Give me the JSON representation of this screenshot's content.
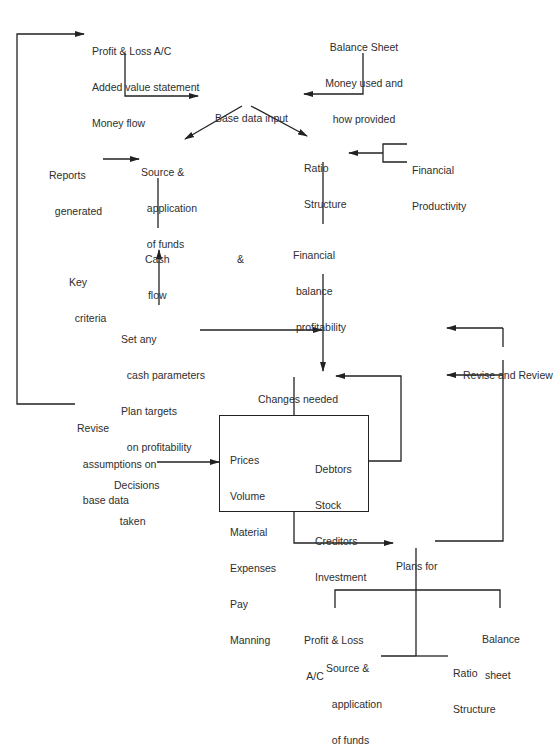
{
  "diagram": {
    "colors": {
      "ink": "#222222",
      "text": "#2e2e2e",
      "background": "#ffffff"
    },
    "nodes": {
      "profit_loss_top": {
        "lines": [
          "Profit & Loss A/C",
          "Added value statement",
          "Money flow"
        ]
      },
      "balance_sheet_top": {
        "lines": [
          "Balance Sheet",
          "Money used and",
          "how provided"
        ]
      },
      "base_data_input": {
        "lines": [
          "Base data input"
        ]
      },
      "reports_generated": {
        "lines": [
          "Reports",
          "  generated"
        ]
      },
      "source_application": {
        "lines": [
          "Source &",
          "  application",
          "  of funds"
        ]
      },
      "ratio_structure": {
        "lines": [
          "Ratio",
          "Structure"
        ]
      },
      "financial_productivity": {
        "lines": [
          "Financial",
          "Productivity"
        ]
      },
      "cash_flow": {
        "lines": [
          "Cash",
          " flow"
        ]
      },
      "ampersand": {
        "lines": [
          "&"
        ]
      },
      "financial_balance": {
        "lines": [
          "Financial",
          " balance",
          " profitability"
        ]
      },
      "key_criteria": {
        "lines": [
          "Key",
          "  criteria"
        ]
      },
      "set_cash_parameters": {
        "lines": [
          "Set any",
          "  cash parameters",
          "Plan targets",
          "  on profitability"
        ]
      },
      "changes_needed": {
        "lines": [
          "Changes needed"
        ]
      },
      "revise_and_review": {
        "lines": [
          "Revise and Review"
        ]
      },
      "revise_assumptions": {
        "lines": [
          "Revise",
          "  assumptions on",
          "  base data"
        ]
      },
      "decisions_taken": {
        "lines": [
          "Decisions",
          "  taken"
        ]
      },
      "decision_box_left": {
        "lines": [
          "Prices",
          "Volume",
          "Material",
          "Expenses",
          "Pay",
          "Manning"
        ]
      },
      "decision_box_right": {
        "lines": [
          "Debtors",
          "Stock",
          "Creditors",
          "Investment"
        ]
      },
      "plans_for": {
        "lines": [
          "Plans for"
        ]
      },
      "plan_profit_loss": {
        "lines": [
          "Profit & Loss",
          " A/C"
        ]
      },
      "plan_balance_sheet": {
        "lines": [
          "Balance",
          " sheet"
        ]
      },
      "plan_source_application": {
        "lines": [
          "Source &",
          "  application",
          "  of funds"
        ]
      },
      "plan_ratio_structure": {
        "lines": [
          "Ratio",
          "Structure"
        ]
      }
    },
    "edges": [
      {
        "from": "profit_loss_top",
        "to": "base_data_input"
      },
      {
        "from": "balance_sheet_top",
        "to": "base_data_input"
      },
      {
        "from": "base_data_input",
        "to": "source_application"
      },
      {
        "from": "base_data_input",
        "to": "ratio_structure"
      },
      {
        "from": "reports_generated",
        "to": "source_application"
      },
      {
        "from": "financial_productivity",
        "to": "ratio_structure"
      },
      {
        "from": "source_application",
        "to": "cash_flow",
        "arrow": false
      },
      {
        "from": "set_cash_parameters",
        "to": "cash_flow"
      },
      {
        "from": "ratio_structure",
        "to": "financial_balance",
        "arrow": false
      },
      {
        "from": "financial_balance",
        "to": "changes_needed"
      },
      {
        "from": "set_cash_parameters",
        "to": "changes_needed"
      },
      {
        "from": "changes_needed",
        "to": "decision_box",
        "arrow": false
      },
      {
        "from": "decision_box",
        "to": "changes_needed"
      },
      {
        "from": "decisions_taken",
        "to": "decision_box"
      },
      {
        "from": "decision_box",
        "to": "plans_for"
      },
      {
        "from": "plans_for",
        "to": "revise_and_review",
        "arrow": false
      },
      {
        "from": "revise_and_review",
        "to": "set_cash_parameters"
      },
      {
        "from": "revise_and_review",
        "to": "changes_needed"
      },
      {
        "from": "revise_assumptions",
        "to": "profit_loss_top"
      },
      {
        "from": "plans_for",
        "to": "plan_profit_loss",
        "arrow": false
      },
      {
        "from": "plans_for",
        "to": "plan_balance_sheet",
        "arrow": false
      },
      {
        "from": "plans_for",
        "to": "plan_source_application",
        "arrow": false
      },
      {
        "from": "plans_for",
        "to": "plan_ratio_structure",
        "arrow": false
      }
    ]
  }
}
